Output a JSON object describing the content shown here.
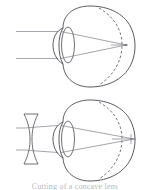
{
  "figure": {
    "caption": "Cutting of a concave lens",
    "background_color": "#ffffff",
    "ink_color": "#4a4a52",
    "ray_color": "#6a6a74",
    "panels": [
      {
        "id": "panel-top",
        "name": "uncorrected-myopic-eye",
        "label": "Myopic eye, uncorrected",
        "correcting_lens": "none",
        "eye_shape": "elongated",
        "focal_point_location": "in front of retina",
        "ray_count": 2,
        "has_dashed_normal_retina": true
      },
      {
        "id": "panel-bottom",
        "name": "corrected-myopic-eye",
        "label": "Myopic eye with concave correcting lens",
        "correcting_lens": "biconcave-diverging",
        "eye_shape": "elongated",
        "focal_point_location": "on retina",
        "ray_count": 2,
        "has_dashed_normal_retina": true
      }
    ],
    "elements": {
      "incoming_ray_label": "parallel incoming light rays",
      "eye_lens_label": "crystalline lens",
      "cornea_label": "cornea",
      "retina_label": "retina",
      "dashed_arc_label": "normal eye retina position",
      "focus_label": "focal point",
      "concave_lens_label": "concave corrective lens"
    }
  }
}
